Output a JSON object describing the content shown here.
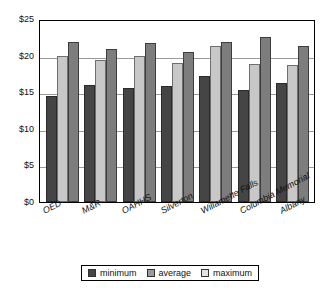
{
  "chart_data": {
    "type": "bar",
    "title": "",
    "xlabel": "",
    "ylabel": "",
    "ylim": [
      0,
      25
    ],
    "ytick_labels": [
      "$0",
      "$5",
      "$10",
      "$15",
      "$20",
      "$25"
    ],
    "ytick_values": [
      0,
      5,
      10,
      15,
      20,
      25
    ],
    "grid": true,
    "legend_position": "bottom",
    "categories": [
      "OED",
      "M&R",
      "OAHHS",
      "Silverton",
      "Willamette Falls",
      "Columbia Memorial",
      "Albany"
    ],
    "series": [
      {
        "name": "minimum",
        "color": "#454545",
        "values": [
          14.5,
          16.0,
          15.6,
          15.8,
          17.2,
          15.3,
          16.2
        ]
      },
      {
        "name": "average",
        "color": "#c8c8c8",
        "values": [
          19.9,
          19.4,
          19.9,
          19.0,
          21.3,
          18.9,
          18.7
        ]
      },
      {
        "name": "maximum",
        "color": "#7d7d7d",
        "values": [
          21.8,
          20.9,
          21.7,
          20.5,
          21.9,
          22.6,
          21.3
        ]
      }
    ]
  },
  "legend": {
    "items": [
      {
        "label": "minimum",
        "key": "minimum"
      },
      {
        "label": "average",
        "key": "average"
      },
      {
        "label": "maximum",
        "key": "maximum"
      }
    ]
  }
}
